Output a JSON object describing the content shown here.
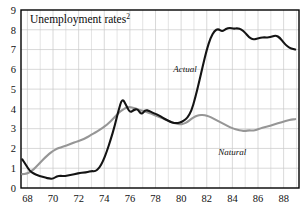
{
  "chart_data": {
    "type": "line",
    "title": "Unemployment rates",
    "title_superscript": "2",
    "xlabel": "",
    "ylabel": "",
    "xlim": [
      67.5,
      89.2
    ],
    "ylim": [
      0,
      9
    ],
    "x_ticks": [
      "68",
      "70",
      "72",
      "74",
      "76",
      "78",
      "80",
      "82",
      "84",
      "86",
      "88"
    ],
    "x_tick_values": [
      68,
      70,
      72,
      74,
      76,
      78,
      80,
      82,
      84,
      86,
      88
    ],
    "x_minor_step": 1,
    "y_ticks": [
      "0",
      "1",
      "2",
      "3",
      "4",
      "5",
      "6",
      "7",
      "8",
      "9"
    ],
    "y_tick_values": [
      0,
      1,
      2,
      3,
      4,
      5,
      6,
      7,
      8,
      9
    ],
    "grid": true,
    "grid_color": "#c8c8c8",
    "frame_color": "#000000",
    "legend": "inline-annotations",
    "annotations": [
      {
        "text": "Actual",
        "x": 80.3,
        "y": 5.85,
        "series": "Actual"
      },
      {
        "text": "Natural",
        "x": 84.0,
        "y": 1.65,
        "series": "Natural"
      }
    ],
    "series": [
      {
        "name": "Actual",
        "color": "#141414",
        "width": 2.1,
        "x": [
          67.6,
          67.9,
          68.2,
          68.5,
          68.8,
          69.1,
          69.4,
          69.7,
          70.0,
          70.3,
          70.6,
          70.9,
          71.2,
          71.5,
          71.8,
          72.1,
          72.4,
          72.7,
          73.0,
          73.3,
          73.6,
          73.9,
          74.2,
          74.5,
          74.8,
          75.1,
          75.4,
          75.7,
          76.0,
          76.3,
          76.6,
          76.9,
          77.2,
          77.5,
          77.8,
          78.1,
          78.4,
          78.7,
          79.0,
          79.3,
          79.6,
          79.9,
          80.2,
          80.5,
          80.8,
          81.1,
          81.4,
          81.7,
          82.0,
          82.3,
          82.6,
          82.9,
          83.2,
          83.5,
          83.8,
          84.1,
          84.4,
          84.7,
          85.0,
          85.3,
          85.6,
          85.9,
          86.2,
          86.5,
          86.8,
          87.1,
          87.4,
          87.7,
          88.0,
          88.3,
          88.6,
          88.9
        ],
        "y": [
          1.45,
          1.15,
          0.85,
          0.72,
          0.64,
          0.58,
          0.52,
          0.48,
          0.46,
          0.6,
          0.62,
          0.6,
          0.64,
          0.68,
          0.72,
          0.76,
          0.78,
          0.8,
          0.86,
          0.84,
          1.0,
          1.35,
          1.85,
          2.45,
          3.1,
          3.9,
          4.55,
          4.2,
          3.8,
          3.95,
          4.0,
          3.7,
          3.95,
          3.9,
          3.8,
          3.72,
          3.62,
          3.5,
          3.4,
          3.3,
          3.28,
          3.3,
          3.4,
          3.55,
          3.9,
          4.55,
          5.35,
          6.2,
          7.0,
          7.6,
          7.95,
          8.05,
          7.9,
          8.05,
          8.1,
          8.05,
          8.08,
          8.02,
          7.85,
          7.62,
          7.5,
          7.55,
          7.6,
          7.62,
          7.6,
          7.66,
          7.72,
          7.6,
          7.35,
          7.15,
          7.05,
          7.0
        ]
      },
      {
        "name": "Natural",
        "color": "#969696",
        "width": 2.1,
        "x": [
          67.6,
          67.9,
          68.2,
          68.5,
          68.8,
          69.1,
          69.4,
          69.7,
          70.0,
          70.3,
          70.6,
          70.9,
          71.2,
          71.5,
          71.8,
          72.1,
          72.4,
          72.7,
          73.0,
          73.3,
          73.6,
          73.9,
          74.2,
          74.5,
          74.8,
          75.1,
          75.4,
          75.7,
          76.0,
          76.3,
          76.6,
          76.9,
          77.2,
          77.5,
          77.8,
          78.1,
          78.4,
          78.7,
          79.0,
          79.3,
          79.6,
          79.9,
          80.2,
          80.5,
          80.8,
          81.1,
          81.4,
          81.7,
          82.0,
          82.3,
          82.6,
          82.9,
          83.2,
          83.5,
          83.8,
          84.1,
          84.4,
          84.7,
          85.0,
          85.3,
          85.6,
          85.9,
          86.2,
          86.5,
          86.8,
          87.1,
          87.4,
          87.7,
          88.0,
          88.3,
          88.6,
          88.9
        ],
        "y": [
          0.7,
          0.72,
          0.8,
          0.95,
          1.15,
          1.35,
          1.55,
          1.72,
          1.88,
          1.98,
          2.06,
          2.12,
          2.18,
          2.26,
          2.34,
          2.4,
          2.48,
          2.58,
          2.7,
          2.8,
          2.92,
          3.05,
          3.2,
          3.38,
          3.58,
          3.78,
          3.95,
          4.06,
          4.1,
          4.05,
          3.98,
          3.92,
          3.86,
          3.8,
          3.72,
          3.64,
          3.56,
          3.48,
          3.4,
          3.32,
          3.26,
          3.22,
          3.24,
          3.34,
          3.5,
          3.62,
          3.68,
          3.7,
          3.66,
          3.58,
          3.48,
          3.38,
          3.28,
          3.18,
          3.08,
          3.0,
          2.94,
          2.9,
          2.88,
          2.92,
          2.9,
          2.94,
          3.02,
          3.08,
          3.12,
          3.18,
          3.24,
          3.3,
          3.36,
          3.42,
          3.46,
          3.48
        ]
      }
    ]
  },
  "layout": {
    "plot_left": 21,
    "plot_right": 299,
    "plot_top": 10,
    "plot_bottom": 188
  }
}
